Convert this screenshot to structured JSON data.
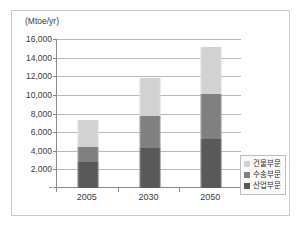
{
  "figure": {
    "axis_unit_label": "(Mtoe/yr)"
  },
  "legend": {
    "entries": [
      {
        "label": "건물부문",
        "color": "#d2d2d2"
      },
      {
        "label": "수송부문",
        "color": "#808080"
      },
      {
        "label": "산업부문",
        "color": "#595959"
      }
    ]
  },
  "chart_data": {
    "type": "bar",
    "stacked": true,
    "title": "",
    "subtitle": "",
    "xlabel": "",
    "ylabel": "(Mtoe/yr)",
    "categories": [
      "2005",
      "2030",
      "2050"
    ],
    "series": [
      {
        "name": "산업부문",
        "color": "#595959",
        "values": [
          2800,
          4250,
          5250
        ]
      },
      {
        "name": "수송부문",
        "color": "#808080",
        "values": [
          1600,
          3450,
          4800
        ]
      },
      {
        "name": "건물부문",
        "color": "#d2d2d2",
        "values": [
          2950,
          4100,
          5050
        ]
      }
    ],
    "totals": [
      7350,
      11800,
      15100
    ],
    "ylim": [
      0,
      16000
    ],
    "ytick_values": [
      0,
      2000,
      4000,
      6000,
      8000,
      10000,
      12000,
      14000,
      16000
    ],
    "ytick_labels": [
      "-",
      "2,000",
      "4,000",
      "6,000",
      "8,000",
      "10,000",
      "12,000",
      "14,000",
      "16,000"
    ],
    "grid": true,
    "legend_position": "right-bottom"
  }
}
